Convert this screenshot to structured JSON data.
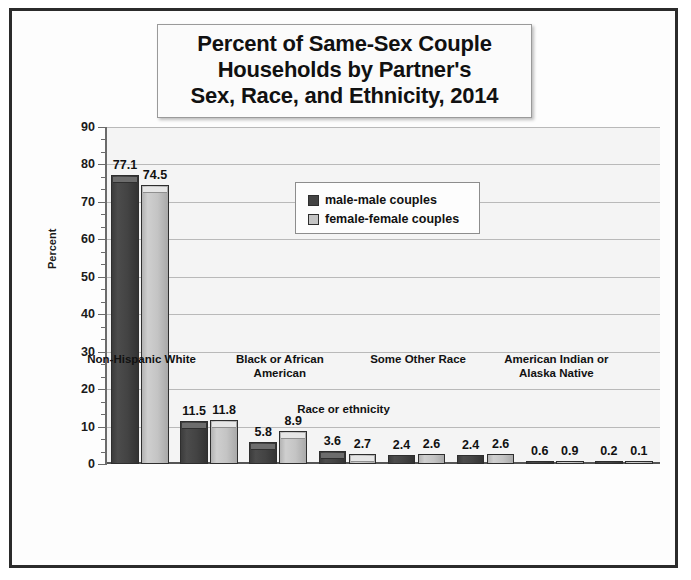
{
  "chart_data": {
    "type": "bar",
    "title": "Percent of Same-Sex Couple Households by Partner's Sex, Race, and Ethnicity, 2014",
    "title_lines": [
      "Percent of Same-Sex Couple",
      "Households by Partner's",
      "Sex, Race, and Ethnicity, 2014"
    ],
    "xlabel": "Race or ethnicity",
    "ylabel": "Percent",
    "ylim": [
      0,
      90
    ],
    "ytick_step": 10,
    "yticks": [
      0,
      10,
      20,
      30,
      40,
      50,
      60,
      70,
      80,
      90
    ],
    "ytick_labels": [
      "0",
      "10",
      "20",
      "30",
      "40",
      "50",
      "60",
      "70",
      "80",
      "90"
    ],
    "grid": true,
    "grid_axis": "y",
    "legend_position": "center",
    "categories": [
      "Non-Hispanic White",
      "",
      "Black or African American",
      "",
      "Some Other Race",
      "",
      "American Indian or Alaska Native"
    ],
    "visible_category_labels": [
      {
        "index": 0,
        "text": "Non-Hispanic White"
      },
      {
        "index": 2,
        "text": "Black or African\nAmerican"
      },
      {
        "index": 4,
        "text": "Some Other Race"
      },
      {
        "index": 6,
        "text": "American Indian or\nAlaska Native"
      }
    ],
    "series": [
      {
        "name": "male-male couples",
        "color": "#434343",
        "values": [
          77.1,
          11.5,
          5.8,
          3.6,
          2.4,
          2.4,
          0.6
        ]
      },
      {
        "name": "female-female couples",
        "color": "#c4c4c4",
        "values": [
          74.5,
          11.8,
          8.9,
          2.7,
          2.6,
          2.6,
          0.9
        ]
      }
    ],
    "extra_bars_note": "",
    "trailing_values": [
      0.2,
      0.1
    ],
    "data_labels": [
      "77.1",
      "74.5",
      "11.5",
      "11.8",
      "5.8",
      "8.9",
      "3.6",
      "2.7",
      "2.4",
      "2.6",
      "2.4",
      "2.6",
      "0.6",
      "0.9",
      "0.2",
      "0.1"
    ]
  },
  "legend": {
    "items": [
      {
        "label": "male-male couples",
        "color": "#434343"
      },
      {
        "label": "female-female couples",
        "color": "#c4c4c4"
      }
    ]
  },
  "colors": {
    "frame": "#2b2b2b",
    "plot_background": "#f4f4f4",
    "gridline": "#b9b9b9",
    "series_male": "#434343",
    "series_female": "#c4c4c4",
    "text": "#111111"
  }
}
